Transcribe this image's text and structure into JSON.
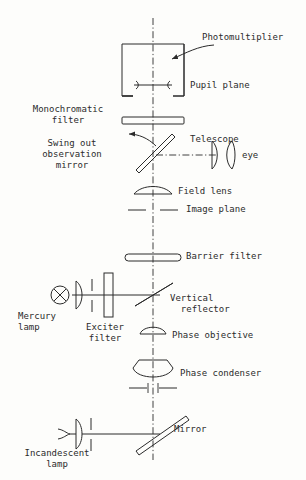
{
  "diagram": {
    "type": "optical-ray-diagram",
    "background_color": "#fdfdfb",
    "ink_color": "#2b2b2b",
    "axis_style": "dash-dot vertical optical axis"
  },
  "labels": {
    "photomultiplier": "Photomultiplier",
    "pupil_plane": "Pupil plane",
    "monochromatic_filter": "Monochromatic\nfilter",
    "swing_out_mirror": "Swing out\nobservation\nmirror",
    "telescope": "Telescope",
    "eye": "eye",
    "field_lens": "Field lens",
    "image_plane": "Image plane",
    "barrier_filter": "Barrier filter",
    "vertical_reflector": "Vertical\n  reflector",
    "mercury_lamp": "Mercury\nlamp",
    "exciter_filter": "Exciter\nfilter",
    "phase_objective": "Phase objective",
    "phase_condenser": "Phase condenser",
    "mirror": "Mirror",
    "incandescent_lamp": "Incandescent\nlamp"
  },
  "components": [
    {
      "name": "photomultiplier",
      "kind": "detector-box"
    },
    {
      "name": "pupil-plane",
      "kind": "aperture-stop"
    },
    {
      "name": "monochromatic-filter",
      "kind": "flat-filter"
    },
    {
      "name": "swing-out-observation-mirror",
      "kind": "tilted-mirror"
    },
    {
      "name": "telescope-lens",
      "kind": "lens"
    },
    {
      "name": "eye",
      "kind": "eye"
    },
    {
      "name": "field-lens",
      "kind": "plano-convex-lens"
    },
    {
      "name": "image-plane",
      "kind": "plane-marker"
    },
    {
      "name": "barrier-filter",
      "kind": "flat-filter"
    },
    {
      "name": "vertical-reflector",
      "kind": "beam-splitter"
    },
    {
      "name": "mercury-lamp",
      "kind": "arc-lamp"
    },
    {
      "name": "mercury-collector-lens",
      "kind": "lens"
    },
    {
      "name": "mercury-aperture",
      "kind": "aperture"
    },
    {
      "name": "exciter-filter",
      "kind": "thick-filter"
    },
    {
      "name": "phase-objective",
      "kind": "objective-lens"
    },
    {
      "name": "phase-condenser",
      "kind": "condenser-lens"
    },
    {
      "name": "condenser-aperture",
      "kind": "aperture"
    },
    {
      "name": "mirror",
      "kind": "tilted-mirror"
    },
    {
      "name": "incandescent-lamp",
      "kind": "filament-lamp"
    },
    {
      "name": "incandescent-collector-lens",
      "kind": "lens"
    },
    {
      "name": "incandescent-aperture",
      "kind": "aperture"
    }
  ]
}
